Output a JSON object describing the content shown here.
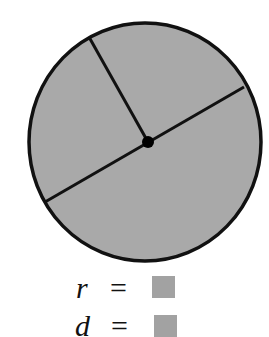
{
  "figure": {
    "circle": {
      "cx": 145,
      "cy": 142,
      "rx": 116,
      "ry": 119,
      "fill": "#a9a9a9",
      "stroke": "#111111",
      "stroke_width": 3.5
    },
    "center_point": {
      "x": 148,
      "y": 142,
      "r": 6,
      "color": "#000000"
    },
    "radius_segment": {
      "x1": 148,
      "y1": 142,
      "x2": 89,
      "y2": 37
    },
    "diameter_segment": {
      "x1": 45,
      "y1": 202,
      "x2": 244,
      "y2": 87
    },
    "line_color": "#111111"
  },
  "equations": [
    {
      "variable": "r",
      "sign": "=",
      "answer_box_color": "#a2a2a2"
    },
    {
      "variable": "d",
      "sign": "=",
      "answer_box_color": "#a2a2a2"
    }
  ]
}
